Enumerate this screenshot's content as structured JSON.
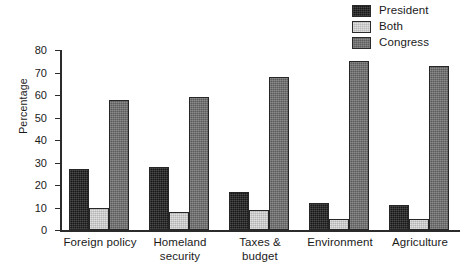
{
  "chart_data": {
    "type": "bar",
    "title": "",
    "subtitle": "",
    "xlabel": "",
    "ylabel": "Percentage",
    "ylim": [
      0,
      80
    ],
    "ytick_labels": [
      "0",
      "10",
      "20",
      "30",
      "40",
      "50",
      "60",
      "70",
      "80"
    ],
    "ytick_values": [
      0,
      10,
      20,
      30,
      40,
      50,
      60,
      70,
      80
    ],
    "grid": false,
    "legend_position": "top-right",
    "categories": [
      "Foreign policy",
      "Homeland\nsecurity",
      "Taxes &\nbudget",
      "Environment",
      "Agriculture"
    ],
    "series": [
      {
        "name": "President",
        "color": "#1c1c1c",
        "values": [
          27,
          28,
          17,
          12,
          11
        ]
      },
      {
        "name": "Both",
        "color": "#d8d8d8",
        "values": [
          10,
          8,
          9,
          5,
          5
        ]
      },
      {
        "name": "Congress",
        "color": "#6e6e6e",
        "values": [
          58,
          59,
          68,
          75,
          73
        ]
      }
    ]
  },
  "legend": {
    "items": [
      {
        "label": "President",
        "color": "#1c1c1c"
      },
      {
        "label": "Both",
        "color": "#d8d8d8"
      },
      {
        "label": "Congress",
        "color": "#6e6e6e"
      }
    ]
  },
  "axes": {
    "y_title": "Percentage"
  },
  "colors": {
    "president": "#1c1c1c",
    "both": "#d8d8d8",
    "congress": "#6e6e6e",
    "axis": "#2b2b2b",
    "background": "#ffffff"
  }
}
